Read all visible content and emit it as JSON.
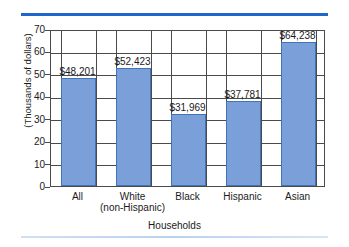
{
  "decor": {
    "top_rule_color": "#1f66cc",
    "bottom_rule_color": "#cfe0f2"
  },
  "chart_data": {
    "type": "bar",
    "title": "",
    "subtitle": "",
    "xlabel": "Households",
    "ylabel": "(Thousands of dollars)",
    "ylim": [
      0,
      70
    ],
    "ytick_step": 10,
    "yticks": [
      "70",
      "60",
      "50",
      "40",
      "30",
      "20",
      "10",
      "0"
    ],
    "grid": true,
    "legend": "none",
    "bar_color": "#7b9fd9",
    "bar_border_color": "#4173b8",
    "categories": [
      "All",
      "White\n(non-Hispanic)",
      "Black",
      "Hispanic",
      "Asian"
    ],
    "category_lines": [
      {
        "line1": "All",
        "line2": ""
      },
      {
        "line1": "White",
        "line2": "(non-Hispanic)"
      },
      {
        "line1": "Black",
        "line2": ""
      },
      {
        "line1": "Hispanic",
        "line2": ""
      },
      {
        "line1": "Asian",
        "line2": ""
      }
    ],
    "values": [
      48.201,
      52.423,
      31.969,
      37.781,
      64.238
    ],
    "value_labels": [
      "$48,201",
      "$52,423",
      "$31,969",
      "$37,781",
      "$64,238"
    ],
    "units": "dollars"
  }
}
